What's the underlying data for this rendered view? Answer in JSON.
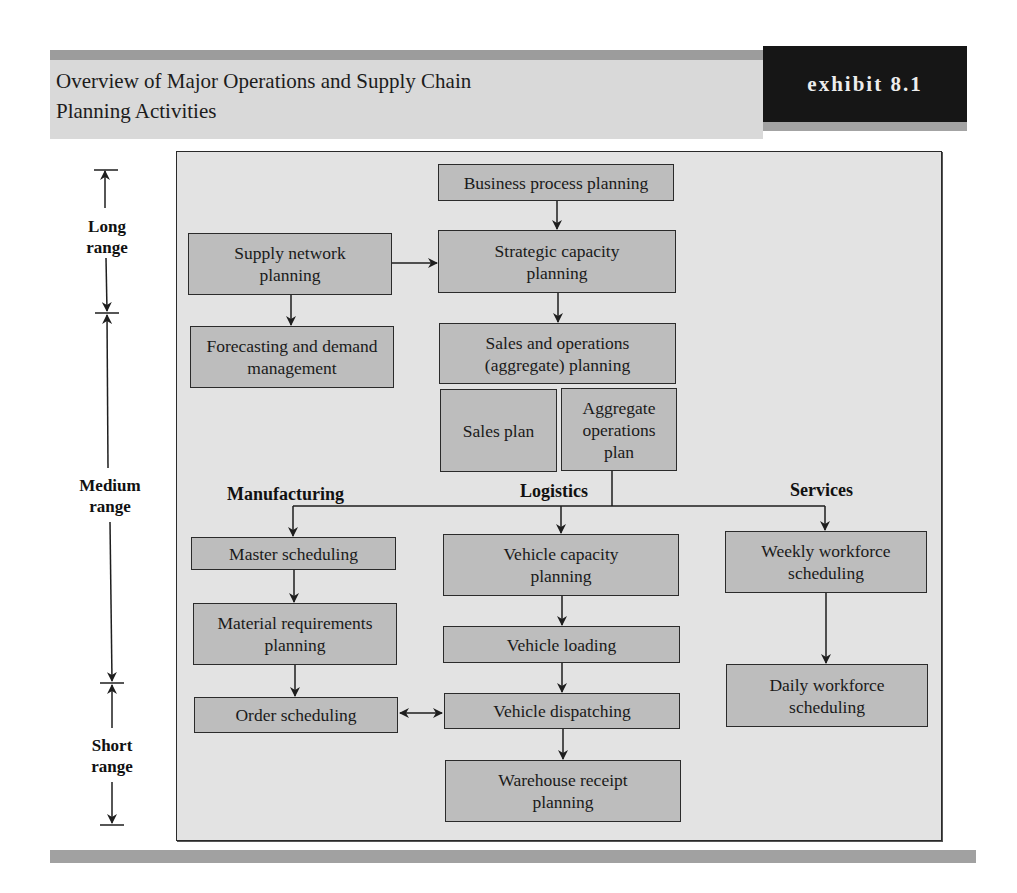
{
  "header": {
    "title_line1": "Overview of Major Operations and Supply Chain",
    "title_line2": "Planning Activities",
    "exhibit": "exhibit 8.1"
  },
  "colors": {
    "node_fill": "#bdbdbd",
    "frame_fill": "#e3e3e3",
    "header_panel": "#d9d9d9",
    "header_bar": "#9c9c9c",
    "exhibit_bg": "#161616",
    "exhibit_text": "#ececec",
    "line": "#1e1e1e"
  },
  "time_ranges": [
    {
      "id": "long",
      "label_line1": "Long",
      "label_line2": "range"
    },
    {
      "id": "medium",
      "label_line1": "Medium",
      "label_line2": "range"
    },
    {
      "id": "short",
      "label_line1": "Short",
      "label_line2": "range"
    }
  ],
  "sections": {
    "manufacturing": "Manufacturing",
    "logistics": "Logistics",
    "services": "Services"
  },
  "nodes": {
    "business_process": "Business process planning",
    "supply_network": "Supply network planning",
    "strategic_capacity": "Strategic capacity planning",
    "forecasting": "Forecasting and demand management",
    "sales_operations": "Sales and operations (aggregate) planning",
    "sales_plan": "Sales plan",
    "aggregate_ops_plan": "Aggregate operations plan",
    "master_scheduling": "Master scheduling",
    "mrp": "Material requirements planning",
    "order_scheduling": "Order scheduling",
    "vehicle_capacity": "Vehicle capacity planning",
    "vehicle_loading": "Vehicle loading",
    "vehicle_dispatching": "Vehicle dispatching",
    "warehouse_receipt": "Warehouse receipt planning",
    "weekly_workforce": "Weekly workforce scheduling",
    "daily_workforce": "Daily workforce scheduling"
  },
  "edges": [
    {
      "from": "business_process",
      "to": "strategic_capacity"
    },
    {
      "from": "supply_network",
      "to": "strategic_capacity"
    },
    {
      "from": "supply_network",
      "to": "forecasting"
    },
    {
      "from": "strategic_capacity",
      "to": "sales_operations"
    },
    {
      "from": "aggregate_ops_plan",
      "to": "master_scheduling"
    },
    {
      "from": "aggregate_ops_plan",
      "to": "vehicle_capacity"
    },
    {
      "from": "aggregate_ops_plan",
      "to": "weekly_workforce"
    },
    {
      "from": "master_scheduling",
      "to": "mrp"
    },
    {
      "from": "mrp",
      "to": "order_scheduling"
    },
    {
      "from": "vehicle_capacity",
      "to": "vehicle_loading"
    },
    {
      "from": "vehicle_loading",
      "to": "vehicle_dispatching"
    },
    {
      "from": "vehicle_dispatching",
      "to": "warehouse_receipt"
    },
    {
      "from": "order_scheduling",
      "to": "vehicle_dispatching",
      "bidirectional": true
    },
    {
      "from": "weekly_workforce",
      "to": "daily_workforce"
    }
  ]
}
